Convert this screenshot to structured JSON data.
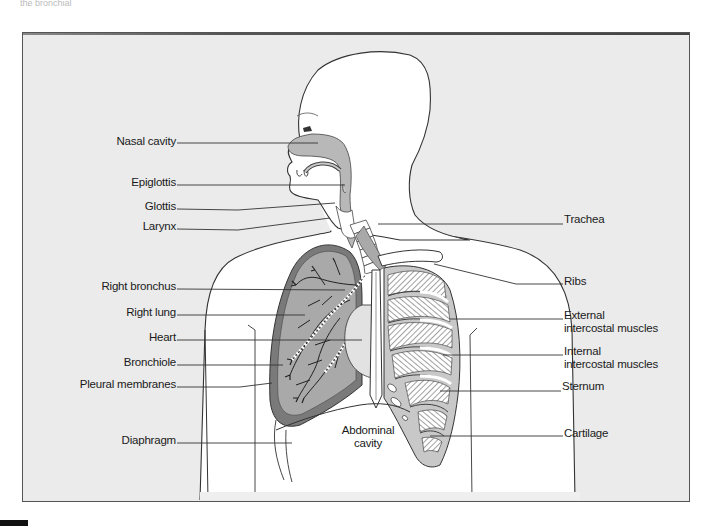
{
  "figure": {
    "title": "",
    "top_caption": "the bronchial tubes.",
    "labels_left": [
      {
        "id": "nasal-cavity",
        "text": "Nasal cavity",
        "x": 176,
        "y": 135,
        "line": [
          {
            "x": 177,
            "y": 143
          },
          {
            "x": 318,
            "y": 143
          }
        ]
      },
      {
        "id": "epiglottis",
        "text": "Epiglottis",
        "x": 176,
        "y": 176,
        "line": [
          {
            "x": 177,
            "y": 185
          },
          {
            "x": 345,
            "y": 185
          }
        ]
      },
      {
        "id": "glottis",
        "text": "Glottis",
        "x": 176,
        "y": 200,
        "line": [
          {
            "x": 177,
            "y": 209
          },
          {
            "x": 238,
            "y": 210
          },
          {
            "x": 335,
            "y": 203
          }
        ]
      },
      {
        "id": "larynx",
        "text": "Larynx",
        "x": 176,
        "y": 220,
        "line": [
          {
            "x": 177,
            "y": 229
          },
          {
            "x": 238,
            "y": 230
          },
          {
            "x": 330,
            "y": 218
          }
        ]
      },
      {
        "id": "right-bronchus",
        "text": "Right bronchus",
        "x": 176,
        "y": 280,
        "line": [
          {
            "x": 177,
            "y": 289
          },
          {
            "x": 345,
            "y": 290
          }
        ]
      },
      {
        "id": "right-lung",
        "text": "Right lung",
        "x": 176,
        "y": 306,
        "line": [
          {
            "x": 177,
            "y": 315
          },
          {
            "x": 305,
            "y": 315
          }
        ]
      },
      {
        "id": "heart",
        "text": "Heart",
        "x": 176,
        "y": 331,
        "line": [
          {
            "x": 177,
            "y": 340
          },
          {
            "x": 362,
            "y": 340
          }
        ]
      },
      {
        "id": "bronchiole",
        "text": "Bronchiole",
        "x": 176,
        "y": 356,
        "line": [
          {
            "x": 177,
            "y": 365
          },
          {
            "x": 283,
            "y": 365
          }
        ]
      },
      {
        "id": "pleural-membranes",
        "text": "Pleural membranes",
        "x": 176,
        "y": 378,
        "line": [
          {
            "x": 177,
            "y": 387
          },
          {
            "x": 240,
            "y": 387
          },
          {
            "x": 272,
            "y": 383
          }
        ]
      },
      {
        "id": "diaphragm",
        "text": "Diaphragm",
        "x": 176,
        "y": 434,
        "line": [
          {
            "x": 177,
            "y": 443
          },
          {
            "x": 292,
            "y": 443
          }
        ]
      }
    ],
    "labels_right": [
      {
        "id": "trachea",
        "text": "Trachea",
        "x": 564,
        "y": 213,
        "multiline": false,
        "line": [
          {
            "x": 378,
            "y": 224
          },
          {
            "x": 563,
            "y": 224
          }
        ]
      },
      {
        "id": "ribs",
        "text": "Ribs",
        "x": 564,
        "y": 275,
        "multiline": false,
        "line": [
          {
            "x": 434,
            "y": 264
          },
          {
            "x": 516,
            "y": 284
          },
          {
            "x": 563,
            "y": 284
          }
        ]
      },
      {
        "id": "external-intercostal-muscles",
        "text": "External",
        "text2": "intercostal muscles",
        "x": 564,
        "y": 309,
        "multiline": true,
        "line": [
          {
            "x": 450,
            "y": 319
          },
          {
            "x": 563,
            "y": 319
          }
        ]
      },
      {
        "id": "internal-intercostal-muscles",
        "text": "Internal",
        "text2": "intercostal muscles",
        "x": 564,
        "y": 345,
        "multiline": true,
        "line": [
          {
            "x": 443,
            "y": 355
          },
          {
            "x": 563,
            "y": 355
          }
        ]
      },
      {
        "id": "sternum",
        "text": "Sternum",
        "x": 562,
        "y": 380,
        "multiline": false,
        "line": [
          {
            "x": 440,
            "y": 391
          },
          {
            "x": 561,
            "y": 391
          }
        ]
      },
      {
        "id": "cartilage",
        "text": "Cartilage",
        "x": 564,
        "y": 427,
        "multiline": false,
        "line": [
          {
            "x": 430,
            "y": 436
          },
          {
            "x": 563,
            "y": 436
          }
        ]
      }
    ],
    "labels_center": [
      {
        "id": "abdominal-cavity",
        "text": "Abdominal",
        "text2": "cavity",
        "x": 368,
        "y": 424
      }
    ],
    "colors": {
      "background_frame": "#ebebeb",
      "body_fill": "#ffffff",
      "outline": "#333333",
      "lung_fill": "#a9a9a9",
      "lung_edge": "#777777",
      "airway_fill": "#bdbdbd",
      "rib_cage_fill": "#c8c8c8",
      "leader_line": "#333333"
    }
  }
}
